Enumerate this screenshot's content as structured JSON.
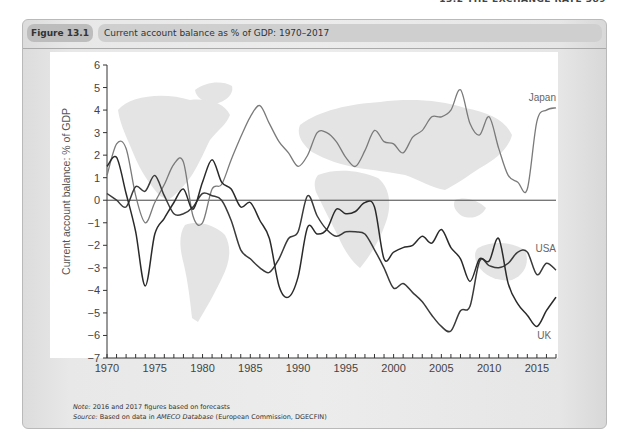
{
  "page": {
    "running_head": "13.2 THE EXCHANGE RATE 389"
  },
  "figure": {
    "label": "Figure 13.1",
    "title": "Current account balance as % of GDP: 1970–2017",
    "note_prefix": "Note:",
    "note_text": " 2016 and 2017 figures based on forecasts",
    "source_prefix": "Source:",
    "source_text_1": " Based on data in ",
    "source_italic": "AMECO Database",
    "source_text_2": " (European Commission, DGECFIN)"
  },
  "chart_data": {
    "type": "line",
    "title": "Current account balance as % of GDP: 1970–2017",
    "xlabel": "",
    "ylabel": "Current account balance: % of GDP",
    "xlim": [
      1970,
      2017
    ],
    "ylim": [
      -7,
      6
    ],
    "x_ticks": [
      1970,
      1975,
      1980,
      1985,
      1990,
      1995,
      2000,
      2005,
      2010,
      2015
    ],
    "y_ticks": [
      6,
      5,
      4,
      3,
      2,
      1,
      0,
      -1,
      -2,
      -3,
      -4,
      -5,
      -6,
      -7
    ],
    "y_tick_labels": [
      "6",
      "5",
      "4",
      "3",
      "2",
      "1",
      "0",
      "−1",
      "−2",
      "−3",
      "−4",
      "−5",
      "−6",
      "−7"
    ],
    "grid": false,
    "zero_line": true,
    "legend": "inline-labels-right",
    "x": [
      1970,
      1971,
      1972,
      1973,
      1974,
      1975,
      1976,
      1977,
      1978,
      1979,
      1980,
      1981,
      1982,
      1983,
      1984,
      1985,
      1986,
      1987,
      1988,
      1989,
      1990,
      1991,
      1992,
      1993,
      1994,
      1995,
      1996,
      1997,
      1998,
      1999,
      2000,
      2001,
      2002,
      2003,
      2004,
      2005,
      2006,
      2007,
      2008,
      2009,
      2010,
      2011,
      2012,
      2013,
      2014,
      2015,
      2016,
      2017
    ],
    "series": [
      {
        "name": "Japan",
        "color": "#7a7a7a",
        "values": [
          1.1,
          2.5,
          2.3,
          0.2,
          -1.0,
          -0.1,
          0.7,
          1.6,
          1.7,
          -0.7,
          -1.0,
          0.5,
          0.7,
          1.8,
          2.8,
          3.7,
          4.2,
          3.4,
          2.6,
          2.1,
          1.5,
          2.0,
          3.0,
          3.0,
          2.6,
          1.9,
          1.5,
          2.2,
          3.1,
          2.6,
          2.5,
          2.1,
          2.8,
          3.1,
          3.7,
          3.7,
          4.0,
          4.9,
          3.4,
          2.9,
          3.7,
          2.3,
          1.1,
          0.8,
          0.5,
          3.5,
          4.0,
          4.1
        ]
      },
      {
        "name": "USA",
        "color": "#3a3a3a",
        "values": [
          0.3,
          0.0,
          -0.3,
          0.6,
          0.4,
          1.1,
          0.2,
          -0.6,
          -0.6,
          -0.3,
          0.3,
          0.2,
          0.0,
          -0.9,
          -2.2,
          -2.6,
          -3.0,
          -3.2,
          -2.6,
          -1.7,
          -1.4,
          0.2,
          -0.7,
          -1.3,
          -1.6,
          -1.4,
          -1.4,
          -1.5,
          -2.2,
          -3.0,
          -3.9,
          -3.7,
          -4.1,
          -4.5,
          -5.1,
          -5.6,
          -5.8,
          -4.9,
          -4.7,
          -2.7,
          -2.9,
          -3.0,
          -2.8,
          -2.3,
          -2.3,
          -3.3,
          -2.8,
          -3.1
        ]
      },
      {
        "name": "UK",
        "color": "#2a2a2a",
        "values": [
          1.5,
          1.9,
          0.3,
          -1.4,
          -3.8,
          -1.5,
          -0.8,
          -0.1,
          0.5,
          -0.4,
          0.8,
          1.8,
          0.8,
          0.5,
          -0.3,
          -0.1,
          -0.9,
          -1.7,
          -3.8,
          -4.3,
          -3.4,
          -1.2,
          -1.5,
          -1.3,
          -0.4,
          -0.6,
          -0.5,
          -0.1,
          -0.3,
          -2.6,
          -2.3,
          -2.1,
          -2.0,
          -1.6,
          -1.9,
          -1.3,
          -2.1,
          -2.6,
          -3.6,
          -2.6,
          -2.7,
          -1.7,
          -3.7,
          -4.6,
          -5.1,
          -5.6,
          -4.9,
          -4.3
        ]
      }
    ],
    "annotations": [
      {
        "text": "Japan",
        "series": "Japan"
      },
      {
        "text": "USA",
        "series": "USA"
      },
      {
        "text": "UK",
        "series": "UK"
      }
    ]
  }
}
